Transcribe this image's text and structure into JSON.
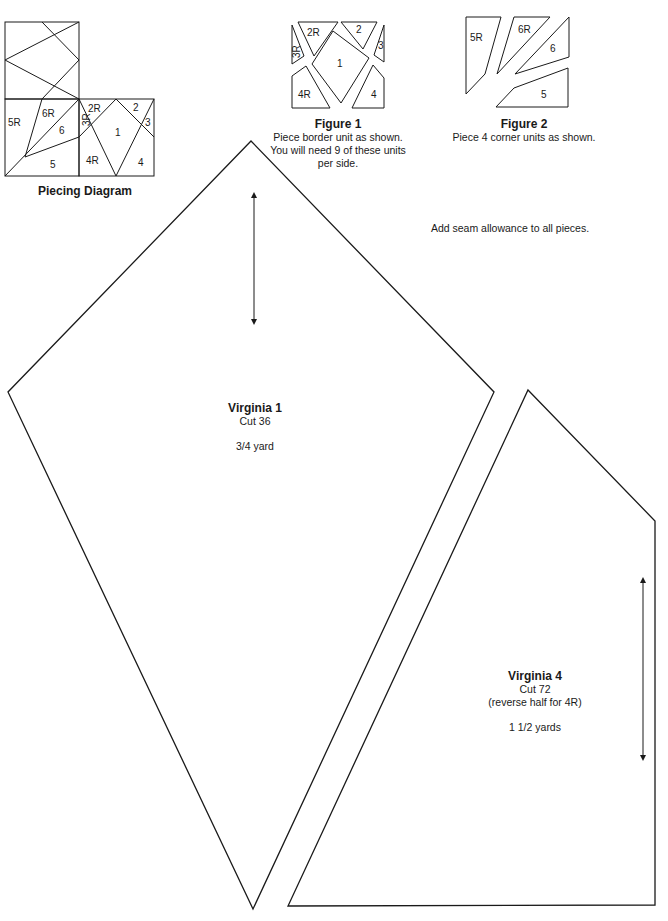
{
  "piecing_diagram": {
    "title": "Piecing Diagram",
    "labels": [
      "5R",
      "6R",
      "6",
      "3R",
      "2R",
      "2",
      "3",
      "1",
      "5",
      "4R",
      "4"
    ]
  },
  "figure1": {
    "title": "Figure 1",
    "caption_lines": [
      "Piece border unit as shown.",
      "You will need 9 of these units",
      "per side."
    ],
    "labels": [
      "2R",
      "2",
      "3R",
      "3",
      "1",
      "4R",
      "4"
    ]
  },
  "figure2": {
    "title": "Figure 2",
    "caption": "Piece 4 corner units as shown.",
    "labels": [
      "5R",
      "6R",
      "6",
      "5"
    ]
  },
  "note": "Add seam allowance to all pieces.",
  "template_virginia1": {
    "name": "Virginia 1",
    "cut": "Cut 36",
    "yardage": "3/4 yard"
  },
  "template_virginia4": {
    "name": "Virginia 4",
    "cut": "Cut 72",
    "note": "(reverse half for 4R)",
    "yardage": "1 1/2 yards"
  },
  "colors": {
    "line": "#1a1a1a",
    "background": "#ffffff"
  }
}
